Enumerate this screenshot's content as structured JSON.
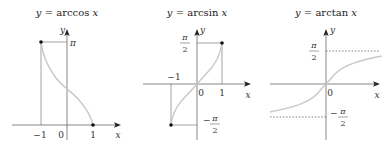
{
  "figure": {
    "panels": [
      {
        "id": "arccos",
        "title_lhs": "y",
        "title_eq": " = ",
        "title_fn": "arccos ",
        "title_var": "x",
        "x_axis_label": "x",
        "y_axis_label": "y",
        "tick_labels": {
          "neg_one": "−1",
          "zero": "0",
          "one": "1",
          "pi": "π"
        },
        "endpoints": [
          [
            -1,
            "π"
          ],
          [
            1,
            0
          ]
        ],
        "domain": [
          -1,
          1
        ],
        "range": [
          "0",
          "π"
        ]
      },
      {
        "id": "arcsin",
        "title_lhs": "y",
        "title_eq": " = ",
        "title_fn": "arcsin ",
        "title_var": "x",
        "x_axis_label": "x",
        "y_axis_label": "y",
        "tick_labels": {
          "neg_one": "−1",
          "zero": "0",
          "one": "1",
          "pi": "π",
          "two": "2",
          "minus": "−"
        },
        "endpoints": [
          [
            -1,
            "−π/2"
          ],
          [
            1,
            "π/2"
          ]
        ],
        "domain": [
          -1,
          1
        ],
        "range": [
          "−π/2",
          "π/2"
        ]
      },
      {
        "id": "arctan",
        "title_lhs": "y",
        "title_eq": " = ",
        "title_fn": "arctan ",
        "title_var": "x",
        "x_axis_label": "x",
        "y_axis_label": "y",
        "tick_labels": {
          "zero": "0",
          "pi": "π",
          "two": "2",
          "minus": "−"
        },
        "asymptotes": [
          "π/2",
          "−π/2"
        ],
        "domain": [
          "−∞",
          "∞"
        ],
        "range": [
          "−π/2",
          "π/2"
        ]
      }
    ],
    "colors": {
      "curve": "#c8c8c8",
      "axis": "#555555",
      "point": "#111111"
    }
  }
}
